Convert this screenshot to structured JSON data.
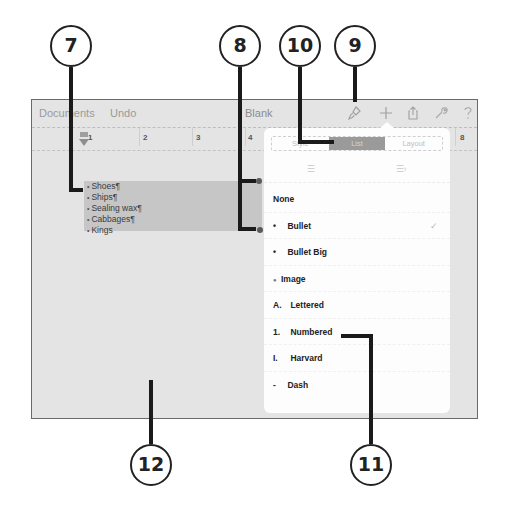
{
  "toolbar": {
    "documents_label": "Documents",
    "undo_label": "Undo",
    "title": "Blank",
    "icons": [
      "paintbrush-icon",
      "plus-icon",
      "share-icon",
      "wrench-icon",
      "help-icon"
    ],
    "icon_glyphs": {
      "brush": "♎",
      "plus": "+",
      "share": "⇧",
      "wrench": "✎",
      "help": "?"
    }
  },
  "ruler": {
    "numbers": [
      "1",
      "2",
      "3",
      "4",
      "8"
    ]
  },
  "document": {
    "list_items": [
      "Shoes¶",
      "Ships¶",
      "Sealing wax¶",
      "Cabbages¶",
      "Kings"
    ]
  },
  "popover": {
    "tabs": [
      {
        "label": "Style",
        "active": false
      },
      {
        "label": "List",
        "active": true
      },
      {
        "label": "Layout",
        "active": false
      }
    ],
    "align_icons": [
      "outdent-icon",
      "indent-icon"
    ],
    "align_glyphs": [
      "☰",
      "☰›"
    ],
    "list_styles": [
      {
        "prefix": "",
        "label": "None",
        "selected": false
      },
      {
        "prefix": "•",
        "label": "Bullet",
        "selected": true
      },
      {
        "prefix": "•",
        "label": "Bullet Big",
        "selected": false
      },
      {
        "prefix": "●",
        "label": "Image",
        "selected": false
      },
      {
        "prefix": "A.",
        "label": "Lettered",
        "selected": false
      },
      {
        "prefix": "1.",
        "label": "Numbered",
        "selected": false
      },
      {
        "prefix": "I.",
        "label": "Harvard",
        "selected": false
      },
      {
        "prefix": "-",
        "label": "Dash",
        "selected": false
      }
    ],
    "checkmark": "✓"
  },
  "callouts": {
    "c7": "7",
    "c8": "8",
    "c9": "9",
    "c10": "10",
    "c11": "11",
    "c12": "12"
  },
  "colors": {
    "canvas": "#e4e4e4",
    "selection": "#c6c6c6",
    "active_tab": "#9a9a9a",
    "popover": "#fdfdfd"
  }
}
